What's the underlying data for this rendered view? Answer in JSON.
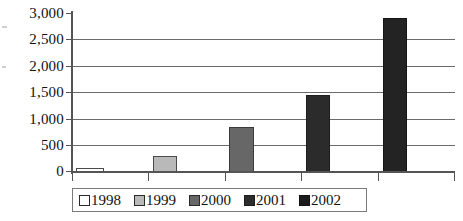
{
  "chart_data": {
    "type": "bar",
    "title": "",
    "xlabel": "",
    "ylabel": "",
    "categories": [
      "1998",
      "1999",
      "2000",
      "2001",
      "2002"
    ],
    "values": [
      70,
      300,
      850,
      1450,
      2900
    ],
    "ylim": [
      0,
      3000
    ],
    "y_ticks": [
      3000,
      2500,
      2000,
      1500,
      1000,
      500,
      0
    ],
    "y_tick_labels": [
      "3,000",
      "2,500",
      "2,000",
      "1,500",
      "1,000",
      "500",
      "0"
    ],
    "grid": true,
    "grid_axis": "y",
    "legend_position": "bottom",
    "series": [
      {
        "name": "1998",
        "value": 70,
        "color": "#ffffff"
      },
      {
        "name": "1999",
        "value": 300,
        "color": "#b9b9b9"
      },
      {
        "name": "2000",
        "value": 850,
        "color": "#676767"
      },
      {
        "name": "2001",
        "value": 1450,
        "color": "#2b2b2b"
      },
      {
        "name": "2002",
        "value": 2900,
        "color": "#232323"
      }
    ]
  },
  "axis": {
    "y_labels": [
      "3,000",
      "2,500",
      "2,000",
      "1,500",
      "1,000",
      "500",
      "0"
    ]
  },
  "legend": {
    "items": [
      {
        "label": "1998"
      },
      {
        "label": "1999"
      },
      {
        "label": "2000"
      },
      {
        "label": "2001"
      },
      {
        "label": "2002"
      }
    ]
  }
}
